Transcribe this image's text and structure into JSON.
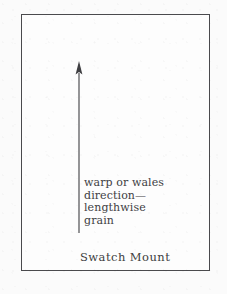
{
  "figure": {
    "caption": "Swatch Mount",
    "frame": {
      "shape": "rectangle",
      "stroke_color": "#4a4a4d",
      "fill_color": "#fdfdfd"
    },
    "background_color": "#fbfbfb"
  },
  "arrow": {
    "name": "grain-direction-arrow",
    "direction": "up",
    "color": "#3f3f42",
    "tip_label": "",
    "annotation_lines": [
      "warp or wales",
      "direction—",
      "lengthwise",
      "grain"
    ],
    "annotation_text": "warp or wales direction—lengthwise grain"
  }
}
